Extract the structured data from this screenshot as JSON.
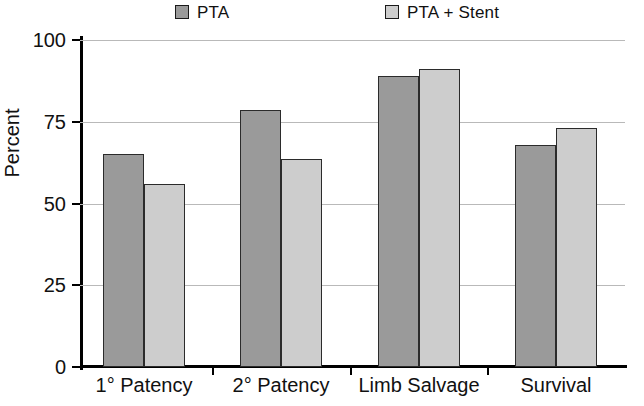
{
  "chart_data": {
    "type": "bar",
    "title": "",
    "xlabel": "",
    "ylabel": "Percent",
    "ylim": [
      0,
      100
    ],
    "yticks": [
      0,
      25,
      50,
      75,
      100
    ],
    "ytick_labels": [
      "0",
      "25",
      "50",
      "75",
      "100"
    ],
    "grid": true,
    "legend_position": "top",
    "categories": [
      "1° Patency",
      "2° Patency",
      "Limb Salvage",
      "Survival"
    ],
    "series": [
      {
        "name": "PTA",
        "color": "#9a9a9a",
        "values": [
          65,
          78.5,
          89,
          68
        ]
      },
      {
        "name": "PTA + Stent",
        "color": "#cdcdcd",
        "values": [
          56,
          63.5,
          91,
          73
        ]
      }
    ]
  },
  "legend": {
    "entries": [
      {
        "label": "PTA",
        "swatch": "legend-swatch-pta"
      },
      {
        "label": "PTA + Stent",
        "swatch": "legend-swatch-pta-stent"
      }
    ]
  },
  "axes": {
    "y_title": "Percent",
    "y_tick_labels": [
      "100",
      "75",
      "50",
      "25",
      "0"
    ],
    "x_tick_labels": [
      "1° Patency",
      "2° Patency",
      "Limb Salvage",
      "Survival"
    ]
  },
  "colors": {
    "series_1": "#9a9a9a",
    "series_2": "#cdcdcd",
    "axis": "#000000",
    "gridline": "#b9b9b9",
    "bar_border": "#2b2b2b",
    "background": "#ffffff"
  }
}
